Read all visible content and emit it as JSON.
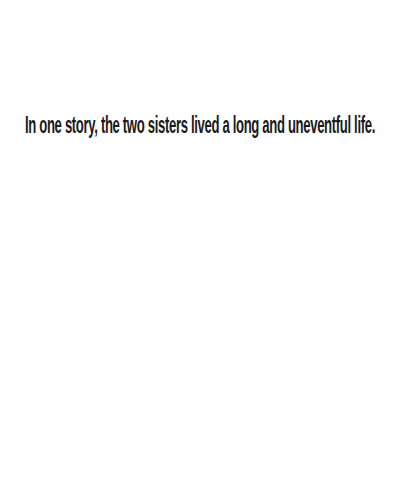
{
  "page": {
    "background": "#ffffff",
    "text_color": "#1a1a1a",
    "caption": "In one story, the two sisters lived a long and uneventful life."
  }
}
